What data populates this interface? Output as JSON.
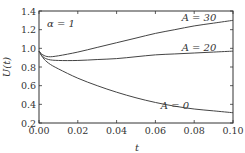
{
  "chart_data": {
    "type": "line",
    "title": "",
    "xlabel": "t",
    "ylabel": "U(t)",
    "xlim": [
      0,
      0.1
    ],
    "ylim": [
      0.2,
      1.4
    ],
    "grid": false,
    "legend": "inline labels",
    "annotation": "α = 1",
    "x_ticks": [
      "0.00",
      "0.02",
      "0.04",
      "0.06",
      "0.08",
      "0.10"
    ],
    "y_ticks": [
      "0.2",
      "0.4",
      "0.6",
      "0.8",
      "1.0",
      "1.2",
      "1.4"
    ],
    "x": [
      0,
      0.002,
      0.005,
      0.01,
      0.02,
      0.03,
      0.04,
      0.05,
      0.06,
      0.07,
      0.08,
      0.09,
      0.1
    ],
    "series": [
      {
        "name": "A = 30",
        "label": "A = 30",
        "values": [
          0.97,
          0.93,
          0.91,
          0.92,
          0.96,
          1.01,
          1.06,
          1.11,
          1.16,
          1.2,
          1.24,
          1.27,
          1.3
        ]
      },
      {
        "name": "A = 20",
        "label": "A = 20",
        "values": [
          0.97,
          0.91,
          0.88,
          0.87,
          0.87,
          0.88,
          0.89,
          0.91,
          0.93,
          0.94,
          0.95,
          0.96,
          0.97
        ]
      },
      {
        "name": "A = 0",
        "label": "A = 0",
        "values": [
          0.97,
          0.9,
          0.84,
          0.78,
          0.68,
          0.6,
          0.53,
          0.47,
          0.42,
          0.38,
          0.35,
          0.33,
          0.31
        ]
      }
    ]
  }
}
